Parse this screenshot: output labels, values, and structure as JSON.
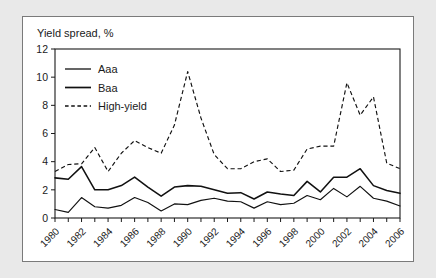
{
  "chart_data": {
    "type": "line",
    "title": "Yield spread, %",
    "xlabel": "",
    "ylabel": "",
    "ylim": [
      0,
      12
    ],
    "yticks": [
      0,
      2,
      4,
      6,
      8,
      10,
      12
    ],
    "xlim": [
      1980,
      2006
    ],
    "xticks": [
      1980,
      1982,
      1984,
      1986,
      1988,
      1990,
      1992,
      1994,
      1996,
      1998,
      2000,
      2002,
      2004,
      2006
    ],
    "xtick_labels": [
      "1980",
      "1982",
      "1984",
      "1986",
      "1988",
      "1990",
      "1992",
      "1994",
      "1996",
      "1998",
      "2000",
      "2002",
      "2004",
      "2006"
    ],
    "grid": false,
    "legend_position": "top-left",
    "x": [
      1980,
      1981,
      1982,
      1983,
      1984,
      1985,
      1986,
      1987,
      1988,
      1989,
      1990,
      1991,
      1992,
      1993,
      1994,
      1995,
      1996,
      1997,
      1998,
      1999,
      2000,
      2001,
      2002,
      2003,
      2004,
      2005,
      2006
    ],
    "series": [
      {
        "name": "Aaa",
        "style": "solid-thin",
        "values": [
          0.6,
          0.4,
          1.45,
          0.8,
          0.7,
          0.9,
          1.45,
          1.1,
          0.5,
          1.0,
          0.95,
          1.25,
          1.4,
          1.2,
          1.15,
          0.7,
          1.15,
          0.95,
          1.05,
          1.6,
          1.3,
          2.1,
          1.5,
          2.25,
          1.4,
          1.2,
          0.85
        ]
      },
      {
        "name": "Baa",
        "style": "solid-thick",
        "values": [
          2.85,
          2.75,
          3.65,
          2.0,
          2.0,
          2.3,
          2.9,
          2.2,
          1.55,
          2.2,
          2.3,
          2.25,
          2.0,
          1.75,
          1.8,
          1.35,
          1.85,
          1.7,
          1.6,
          2.6,
          1.85,
          2.9,
          2.9,
          3.5,
          2.3,
          1.95,
          1.75
        ]
      },
      {
        "name": "High-yield",
        "style": "dashed",
        "values": [
          3.3,
          3.8,
          3.85,
          5.0,
          3.3,
          4.6,
          5.5,
          5.0,
          4.6,
          6.6,
          10.4,
          7.1,
          4.5,
          3.5,
          3.5,
          4.0,
          4.2,
          3.3,
          3.4,
          4.9,
          5.1,
          5.1,
          9.6,
          7.3,
          8.6,
          3.9,
          3.5
        ]
      }
    ],
    "legend": [
      {
        "label": "Aaa",
        "style": "solid-thin"
      },
      {
        "label": "Baa",
        "style": "solid-thick"
      },
      {
        "label": "High-yield",
        "style": "dashed"
      }
    ]
  },
  "colors": {
    "background": "#e9e9e9",
    "panel": "#ffffff",
    "panel_border": "#7a7a7a",
    "ink": "#111111"
  }
}
